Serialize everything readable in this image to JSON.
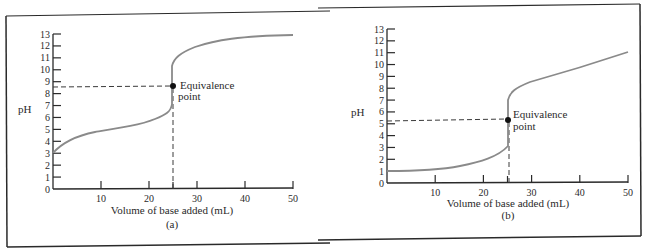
{
  "panels": [
    {
      "id": "a",
      "caption": "(a)",
      "xlabel": "Volume of base added (mL)",
      "ylabel": "pH",
      "annotation_line1": "Equivalence",
      "annotation_line2": "point",
      "y_ticks": [
        "0",
        "1",
        "2",
        "3",
        "4",
        "5",
        "6",
        "7",
        "8",
        "9",
        "10",
        "11",
        "12",
        "13"
      ],
      "x_ticks": [
        "10",
        "20",
        "30",
        "40",
        "50"
      ]
    },
    {
      "id": "b",
      "caption": "(b)",
      "xlabel": "Volume of base added (mL)",
      "ylabel": "pH",
      "annotation_line1": "Equivalence",
      "annotation_line2": "point",
      "y_ticks": [
        "0",
        "1",
        "2",
        "3",
        "4",
        "5",
        "6",
        "7",
        "8",
        "9",
        "10",
        "11",
        "12",
        "13"
      ],
      "x_ticks": [
        "10",
        "20",
        "30",
        "40",
        "50"
      ]
    }
  ],
  "colors": {
    "curve": "#8a8a8a",
    "axis": "#2a2a2a",
    "dashed": "#3a3a3a",
    "frame": "#2a2a2a"
  },
  "chart_data": [
    {
      "type": "line",
      "title": "(a) Weak acid titrated with strong base",
      "xlabel": "Volume of base added (mL)",
      "ylabel": "pH",
      "xlim": [
        0,
        50
      ],
      "ylim": [
        0,
        13
      ],
      "x_ticks": [
        10,
        20,
        30,
        40,
        50
      ],
      "y_ticks": [
        0,
        1,
        2,
        3,
        4,
        5,
        6,
        7,
        8,
        9,
        10,
        11,
        12,
        13
      ],
      "grid": false,
      "series": [
        {
          "name": "titration curve",
          "x": [
            0,
            2,
            5,
            10,
            15,
            20,
            23,
            24.5,
            25,
            25,
            25.5,
            27,
            30,
            35,
            40,
            45,
            50
          ],
          "y": [
            3.0,
            3.6,
            4.2,
            4.7,
            5.0,
            5.5,
            6.1,
            6.7,
            7.2,
            10.5,
            11.0,
            11.9,
            12.4,
            12.7,
            12.9,
            13.0,
            13.0
          ]
        }
      ],
      "annotations": [
        {
          "text": "Equivalence point",
          "x": 25,
          "y": 8.7,
          "marker": "dot",
          "dashed_guides": true
        }
      ]
    },
    {
      "type": "line",
      "title": "(b) Strong acid titrated with strong base",
      "xlabel": "Volume of base added (mL)",
      "ylabel": "pH",
      "xlim": [
        0,
        50
      ],
      "ylim": [
        0,
        13
      ],
      "x_ticks": [
        10,
        20,
        30,
        40,
        50
      ],
      "y_ticks": [
        0,
        1,
        2,
        3,
        4,
        5,
        6,
        7,
        8,
        9,
        10,
        11,
        12,
        13
      ],
      "grid": false,
      "series": [
        {
          "name": "titration curve",
          "x": [
            0,
            5,
            10,
            15,
            20,
            23,
            24.5,
            25,
            25,
            25.5,
            27,
            30,
            35,
            40,
            45,
            50
          ],
          "y": [
            1.0,
            1.05,
            1.2,
            1.5,
            2.0,
            2.5,
            2.9,
            3.1,
            7.3,
            7.8,
            8.3,
            8.7,
            9.2,
            9.7,
            10.3,
            11.0
          ]
        }
      ],
      "annotations": [
        {
          "text": "Equivalence point",
          "x": 25,
          "y": 5.3,
          "marker": "dot",
          "dashed_guides": true
        }
      ]
    }
  ]
}
